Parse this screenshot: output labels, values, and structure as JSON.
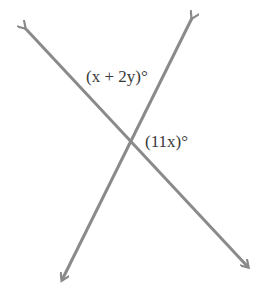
{
  "diagram": {
    "type": "intersecting-lines",
    "line_color": "#8a8a8a",
    "text_color": "#3a3a3a",
    "lines": [
      {
        "name": "line-a",
        "from": [
          25,
          28
        ],
        "to": [
          248,
          267
        ]
      },
      {
        "name": "line-b",
        "from": [
          192,
          18
        ],
        "to": [
          62,
          280
        ]
      }
    ],
    "intersection": [
      130,
      143
    ],
    "labels": {
      "top_angle": "(x + 2y)°",
      "right_angle": "(11x)°"
    }
  }
}
